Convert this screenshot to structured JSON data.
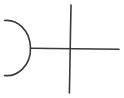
{
  "canvas": {
    "width": 124,
    "height": 98,
    "background_color": "#ffffff",
    "stroke_color": "#3a3a3a",
    "stroke_width": 1.6,
    "description": "line drawing"
  },
  "figure": {
    "name": "arc-and-crossed-lines-sketch",
    "shapes": [
      {
        "id": "arc",
        "type": "arc",
        "label": "left-opening arc",
        "start": {
          "x": 4,
          "y": 20
        },
        "end": {
          "x": 4,
          "y": 76
        },
        "radius_x": 28,
        "radius_y": 28,
        "sweep": 1,
        "large_arc": 0,
        "rightmost_point": {
          "x": 31,
          "y": 48
        },
        "path": "M 4.5 20.5 C 17 19 30 30 30.5 48 C 31 66 17 77 4.5 75.5"
      },
      {
        "id": "horizontal-line",
        "type": "line",
        "label": "horizontal line",
        "start": {
          "x": 30,
          "y": 48
        },
        "end": {
          "x": 119,
          "y": 49
        },
        "path": "M 30.5 48.2 L 119 49.2"
      },
      {
        "id": "vertical-line",
        "type": "line",
        "label": "vertical line",
        "start": {
          "x": 71,
          "y": 5
        },
        "end": {
          "x": 69,
          "y": 93
        },
        "path": "M 71 5 L 69.4 93"
      }
    ],
    "intersections": [
      {
        "id": "arc-line-junction",
        "x": 30,
        "y": 48
      },
      {
        "id": "cross-point",
        "x": 70,
        "y": 49
      }
    ]
  }
}
